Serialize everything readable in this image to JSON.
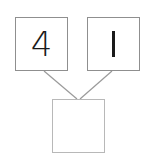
{
  "diagram": {
    "type": "number-bond",
    "parts": [
      {
        "label": "4",
        "value": 4
      },
      {
        "label": "1",
        "value": 1
      }
    ],
    "whole": {
      "label": "",
      "value": null
    },
    "colors": {
      "top_border": "#8f8f8f",
      "bottom_border": "#b8b8b8",
      "connector": "#9a9a9a",
      "text": "#1a1a1a"
    }
  }
}
